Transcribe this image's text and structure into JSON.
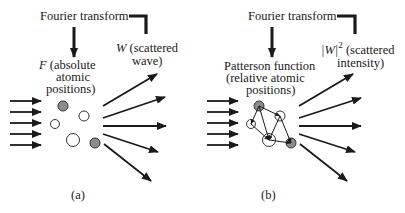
{
  "figure": {
    "panels": [
      {
        "id": "a",
        "caption": "(a)",
        "transform_label": "Fourier transform",
        "source_label": {
          "symbol": "F",
          "line1_rest": " (absolute",
          "line2": "atomic",
          "line3": "positions)"
        },
        "result_label": {
          "symbol": "W",
          "line1_rest": " (scattered",
          "line2": "wave)"
        }
      },
      {
        "id": "b",
        "caption": "(b)",
        "transform_label": "Fourier transform",
        "source_label": {
          "line1": "Patterson function",
          "line2": "(relative atomic",
          "line3": "positions)"
        },
        "result_label": {
          "symbol": "|W|",
          "exponent": "2",
          "line1_rest": " (scattered",
          "line2": "intensity)"
        }
      }
    ],
    "colors": {
      "ink": "#1a1a1a",
      "atom_gray": "#8c8c8c",
      "atom_white": "#ffffff"
    }
  }
}
